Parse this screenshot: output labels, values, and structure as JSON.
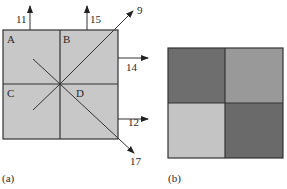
{
  "panel_a": {
    "caption": "(a)",
    "regions": [
      "A",
      "B",
      "C",
      "D"
    ],
    "fill": "#c8c8c8",
    "arrows": [
      {
        "label": "11",
        "direction": "up",
        "origin": "top edge, left half"
      },
      {
        "label": "15",
        "direction": "up",
        "origin": "top edge, right half"
      },
      {
        "label": "9",
        "direction": "up-right",
        "origin": "diagonal through center to top-right corner"
      },
      {
        "label": "14",
        "direction": "right",
        "origin": "right edge, upper half"
      },
      {
        "label": "12",
        "direction": "right",
        "origin": "right edge, lower half"
      },
      {
        "label": "17",
        "direction": "down-right",
        "origin": "diagonal through center to bottom-right corner"
      }
    ]
  },
  "panel_b": {
    "caption": "(b)",
    "quadrants": [
      {
        "position": "top-left",
        "color": "#6e6e6e"
      },
      {
        "position": "top-right",
        "color": "#999999"
      },
      {
        "position": "bottom-left",
        "color": "#c4c4c4"
      },
      {
        "position": "bottom-right",
        "color": "#6a6a6a"
      }
    ]
  }
}
